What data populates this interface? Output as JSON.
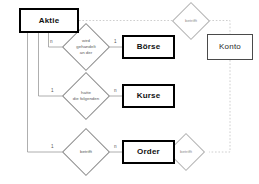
{
  "diagram": {
    "type": "entity-relationship-diagram",
    "colors": {
      "entity_border_strong": "#000000",
      "entity_border_muted": "#4a4a4a",
      "relationship_border": "#8a8a8a",
      "relationship_border_ghost": "#b2b2b2",
      "connector_solid": "#9a9a9a",
      "connector_dotted": "#c2c2c2",
      "background": "#ffffff",
      "text": "#111111",
      "text_muted": "#5a5a5a"
    },
    "entities": [
      {
        "id": "aktie",
        "label": "Aktie",
        "style": "strong"
      },
      {
        "id": "boerse",
        "label": "Börse",
        "style": "strong"
      },
      {
        "id": "kurse",
        "label": "Kurse",
        "style": "strong"
      },
      {
        "id": "order",
        "label": "Order",
        "style": "strong"
      },
      {
        "id": "konto",
        "label": "Konto",
        "style": "muted"
      }
    ],
    "relationships": [
      {
        "id": "wird-gehandelt-an-der",
        "label": "wird\ngehandelt\nan der",
        "from": "aktie",
        "to": "boerse",
        "from_cardinality": "n",
        "to_cardinality": "1",
        "style": "solid"
      },
      {
        "id": "hatte-die-folgenden",
        "label": "hatte\ndie folgenden",
        "from": "aktie",
        "to": "kurse",
        "from_cardinality": "1",
        "to_cardinality": "n",
        "style": "solid"
      },
      {
        "id": "betrifft-order",
        "label": "betrifft",
        "from": "aktie",
        "to": "order",
        "from_cardinality": "1",
        "to_cardinality": "n",
        "style": "solid"
      },
      {
        "id": "betrifft-konto-top",
        "label": "betrifft",
        "from": "aktie",
        "to": "konto",
        "from_cardinality": "",
        "to_cardinality": "",
        "style": "ghost"
      },
      {
        "id": "betrifft-konto-bottom",
        "label": "betrifft",
        "from": "order",
        "to": "konto",
        "from_cardinality": "",
        "to_cardinality": "",
        "style": "ghost"
      }
    ]
  }
}
